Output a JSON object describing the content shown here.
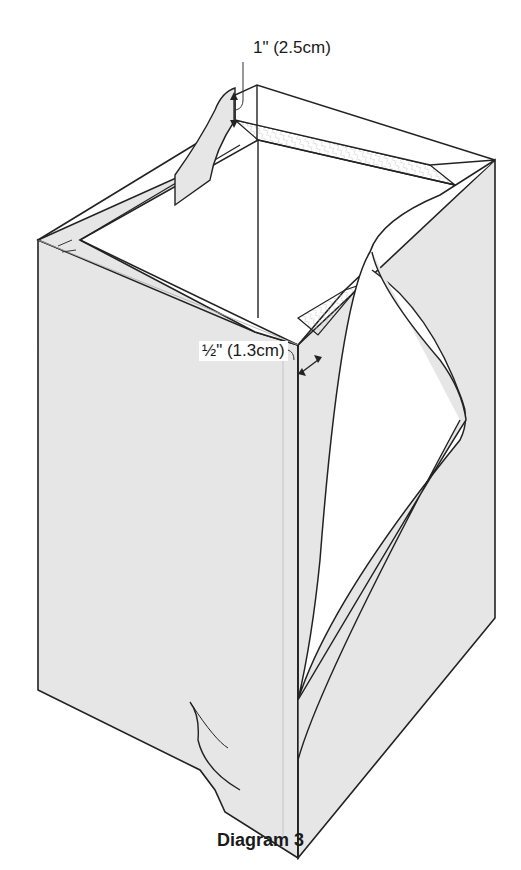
{
  "figure": {
    "caption": "Diagram 3",
    "annotations": {
      "top_allowance": "1\" (2.5cm)",
      "side_allowance": "½\" (1.3cm)"
    },
    "colors": {
      "fabric_fill": "#e6e6e6",
      "interior_fill": "#ffffff",
      "outline": "#222222",
      "text": "#1a1a1a"
    }
  }
}
